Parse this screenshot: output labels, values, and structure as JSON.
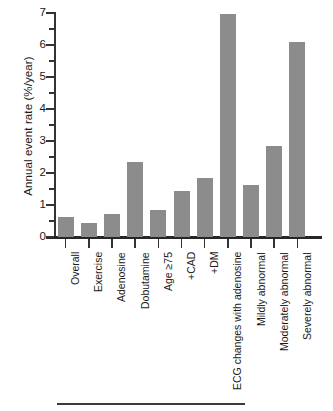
{
  "chart_data": {
    "type": "bar",
    "title": "",
    "xlabel": "",
    "ylabel": "Annual event rate (%/year)",
    "ylim": [
      0,
      7
    ],
    "yticks": [
      0,
      1,
      2,
      3,
      4,
      5,
      6,
      7
    ],
    "ytick_labels": [
      "0",
      "1",
      "2",
      "3",
      "4",
      "5",
      "6",
      "7"
    ],
    "grid": false,
    "legend": "none",
    "bar_color": "#8c8c8c",
    "axis_color": "#333333",
    "categories": [
      "Overall",
      "Exercise",
      "Adenosine",
      "Dobutamine",
      "Age ≥75",
      "+CAD",
      "+DM",
      "ECG changes with adenosine",
      "Mildly abnormal",
      "Moderately abnormal",
      "Severely abnormal"
    ],
    "values": [
      0.6,
      0.4,
      0.7,
      2.3,
      0.8,
      1.4,
      1.8,
      6.95,
      1.6,
      2.8,
      6.05
    ]
  }
}
